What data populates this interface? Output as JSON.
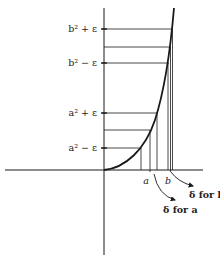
{
  "diagram": {
    "title": "",
    "colors": {
      "stroke": "#1a1a1a",
      "text": "#222222",
      "background": "#ffffff"
    },
    "y_labels": [
      {
        "id": "b2-plus-eps",
        "text": "b² + ε",
        "y": 29
      },
      {
        "id": "b2-minus-eps",
        "text": "b² − ε",
        "y": 63
      },
      {
        "id": "a2-plus-eps",
        "text": "a² + ε",
        "y": 113
      },
      {
        "id": "a2-minus-eps",
        "text": "a² − ε",
        "y": 148
      }
    ],
    "x_labels": [
      {
        "id": "a",
        "text": "a",
        "x": 148
      },
      {
        "id": "b",
        "text": "b",
        "x": 170
      }
    ],
    "annotations": [
      {
        "id": "delta-for-b",
        "text": "δ for b"
      },
      {
        "id": "delta-for-a",
        "text": "δ for a"
      }
    ],
    "curve": "y = x² (parabola from origin)"
  }
}
